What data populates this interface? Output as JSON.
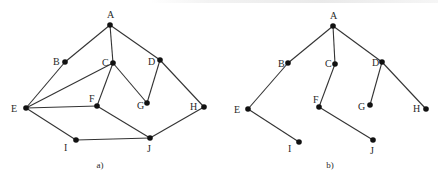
{
  "diagrams": [
    {
      "id": "a",
      "caption": "a)",
      "caption_pos": [
        100,
        168
      ],
      "nodes": [
        {
          "name": "A",
          "x": 110,
          "y": 25,
          "lx": 107,
          "ly": 18
        },
        {
          "name": "B",
          "x": 65,
          "y": 62,
          "lx": 53,
          "ly": 65
        },
        {
          "name": "C",
          "x": 113,
          "y": 63,
          "lx": 102,
          "ly": 66
        },
        {
          "name": "D",
          "x": 160,
          "y": 60,
          "lx": 148,
          "ly": 65
        },
        {
          "name": "E",
          "x": 26,
          "y": 108,
          "lx": 11,
          "ly": 112
        },
        {
          "name": "F",
          "x": 97,
          "y": 106,
          "lx": 89,
          "ly": 102
        },
        {
          "name": "G",
          "x": 147,
          "y": 103,
          "lx": 137,
          "ly": 109
        },
        {
          "name": "H",
          "x": 204,
          "y": 107,
          "lx": 190,
          "ly": 110
        },
        {
          "name": "I",
          "x": 76,
          "y": 140,
          "lx": 64,
          "ly": 151
        },
        {
          "name": "J",
          "x": 150,
          "y": 138,
          "lx": 147,
          "ly": 152
        }
      ],
      "edges": [
        [
          "A",
          "B"
        ],
        [
          "A",
          "C"
        ],
        [
          "A",
          "D"
        ],
        [
          "B",
          "E"
        ],
        [
          "C",
          "E"
        ],
        [
          "C",
          "F"
        ],
        [
          "C",
          "G"
        ],
        [
          "D",
          "G"
        ],
        [
          "D",
          "H"
        ],
        [
          "E",
          "F"
        ],
        [
          "E",
          "I"
        ],
        [
          "F",
          "J"
        ],
        [
          "I",
          "J"
        ],
        [
          "H",
          "J"
        ]
      ]
    },
    {
      "id": "b",
      "caption": "b)",
      "caption_pos": [
        330,
        168
      ],
      "nodes": [
        {
          "name": "A",
          "x": 333,
          "y": 26,
          "lx": 330,
          "ly": 19
        },
        {
          "name": "B",
          "x": 288,
          "y": 63,
          "lx": 278,
          "ly": 67
        },
        {
          "name": "C",
          "x": 335,
          "y": 64,
          "lx": 325,
          "ly": 67
        },
        {
          "name": "D",
          "x": 382,
          "y": 62,
          "lx": 372,
          "ly": 66
        },
        {
          "name": "E",
          "x": 248,
          "y": 109,
          "lx": 234,
          "ly": 113
        },
        {
          "name": "F",
          "x": 319,
          "y": 107,
          "lx": 313,
          "ly": 103
        },
        {
          "name": "G",
          "x": 370,
          "y": 105,
          "lx": 358,
          "ly": 110
        },
        {
          "name": "H",
          "x": 426,
          "y": 109,
          "lx": 413,
          "ly": 112
        },
        {
          "name": "I",
          "x": 299,
          "y": 142,
          "lx": 288,
          "ly": 152
        },
        {
          "name": "J",
          "x": 373,
          "y": 140,
          "lx": 370,
          "ly": 154
        }
      ],
      "edges": [
        [
          "A",
          "B"
        ],
        [
          "A",
          "C"
        ],
        [
          "A",
          "D"
        ],
        [
          "B",
          "E"
        ],
        [
          "E",
          "I"
        ],
        [
          "C",
          "F"
        ],
        [
          "F",
          "J"
        ],
        [
          "D",
          "G"
        ],
        [
          "D",
          "H"
        ]
      ]
    }
  ],
  "colors": {
    "edge": "#333333",
    "node": "#111111",
    "text": "#2a2a2a",
    "background": "#ffffff"
  }
}
